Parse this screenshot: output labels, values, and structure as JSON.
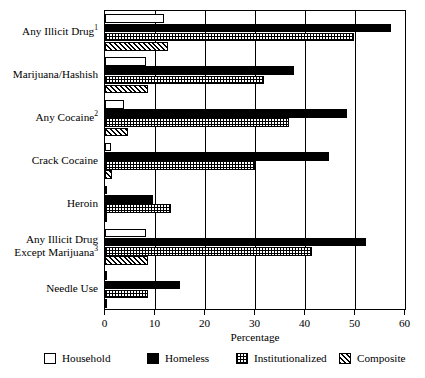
{
  "chart_data": {
    "type": "bar",
    "orientation": "horizontal",
    "title": "",
    "xlabel": "Percentage",
    "ylabel": "",
    "xlim": [
      0,
      60
    ],
    "xticks": [
      0,
      10,
      20,
      30,
      40,
      50,
      60
    ],
    "xtick_labels": [
      "0",
      "10",
      "20",
      "30",
      "40",
      "50",
      "60"
    ],
    "grid": "vertical",
    "legend_position": "bottom",
    "categories": [
      "Any Illicit Drug",
      "Marijuana/Hashish",
      "Any Cocaine",
      "Crack Cocaine",
      "Heroin",
      "Any Illicit Drug Except Marijuana",
      "Needle Use"
    ],
    "category_labels": [
      {
        "text": "Any Illicit Drug",
        "footnote": "1",
        "lines": [
          "Any Illicit Drug"
        ]
      },
      {
        "text": "Marijuana/Hashish",
        "footnote": "",
        "lines": [
          "Marijuana/Hashish"
        ]
      },
      {
        "text": "Any Cocaine",
        "footnote": "2",
        "lines": [
          "Any Cocaine"
        ]
      },
      {
        "text": "Crack Cocaine",
        "footnote": "",
        "lines": [
          "Crack Cocaine"
        ]
      },
      {
        "text": "Heroin",
        "footnote": "",
        "lines": [
          "Heroin"
        ]
      },
      {
        "text": "Any Illicit Drug Except Marijuana",
        "footnote": "3",
        "lines": [
          "Any Illicit Drug",
          "Except Marijuana"
        ]
      },
      {
        "text": "Needle Use",
        "footnote": "",
        "lines": [
          "Needle Use"
        ]
      }
    ],
    "series": [
      {
        "name": "Household",
        "pattern": "white",
        "values": [
          11.8,
          8.2,
          3.8,
          1.1,
          0.2,
          8.2,
          0.2
        ]
      },
      {
        "name": "Homeless",
        "pattern": "black",
        "values": [
          57.2,
          37.7,
          48.3,
          44.7,
          9.5,
          52.2,
          14.9
        ]
      },
      {
        "name": "Institutionalized",
        "pattern": "dotted",
        "values": [
          49.7,
          31.7,
          36.8,
          30.0,
          13.1,
          41.4,
          8.6
        ]
      },
      {
        "name": "Composite",
        "pattern": "diagonal",
        "values": [
          12.5,
          8.6,
          4.6,
          1.3,
          0.3,
          8.5,
          0.3
        ]
      }
    ],
    "legend": [
      {
        "label": "Household",
        "pattern": "white"
      },
      {
        "label": "Homeless",
        "pattern": "black"
      },
      {
        "label": "Institutionalized",
        "pattern": "dotted"
      },
      {
        "label": "Composite",
        "pattern": "diagonal"
      }
    ]
  }
}
